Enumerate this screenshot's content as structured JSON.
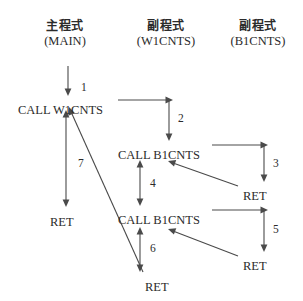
{
  "diagram": {
    "type": "call-return-flow",
    "stroke_color": "#4a4a4a",
    "text_color": "#2b2b2b",
    "background": "#ffffff",
    "columns": [
      {
        "id": "main",
        "cjk": "主程式",
        "romanized": "(MAIN)",
        "x": 65
      },
      {
        "id": "w1cnts",
        "cjk": "副程式",
        "romanized": "(W1CNTS)",
        "x": 166
      },
      {
        "id": "b1cnts",
        "cjk": "副程式",
        "romanized": "(B1CNTS)",
        "x": 258
      }
    ],
    "nodes": [
      {
        "id": "call-w1cnts",
        "label": "CALL W1CNTS",
        "x": 18,
        "y": 104
      },
      {
        "id": "call-b1cnts-1",
        "label": "CALL B1CNTS",
        "x": 118,
        "y": 149
      },
      {
        "id": "ret-right-1",
        "label": "RET",
        "x": 243,
        "y": 190
      },
      {
        "id": "call-b1cnts-2",
        "label": "CALL B1CNTS",
        "x": 118,
        "y": 214
      },
      {
        "id": "ret-left",
        "label": "RET",
        "x": 50,
        "y": 216
      },
      {
        "id": "ret-right-2",
        "label": "RET",
        "x": 243,
        "y": 260
      },
      {
        "id": "ret-bottom",
        "label": "RET",
        "x": 145,
        "y": 281
      }
    ],
    "steps": [
      {
        "number": "1",
        "x": 81,
        "y": 82,
        "from": "main-entry",
        "to": "call-w1cnts"
      },
      {
        "number": "2",
        "x": 178,
        "y": 125,
        "from": "call-w1cnts",
        "to": "call-b1cnts-1"
      },
      {
        "number": "3",
        "x": 284,
        "y": 168,
        "from": "call-b1cnts-1",
        "to": "ret-right-1"
      },
      {
        "number": "4",
        "x": 150,
        "y": 186,
        "from": "ret-right-1",
        "to": "call-b1cnts-2"
      },
      {
        "number": "5",
        "x": 284,
        "y": 236,
        "from": "call-b1cnts-2",
        "to": "ret-right-2"
      },
      {
        "number": "6",
        "x": 150,
        "y": 252,
        "from": "ret-right-2",
        "to": "ret-bottom"
      },
      {
        "number": "7",
        "x": 78,
        "y": 165,
        "from": "ret-bottom",
        "to": "ret-left"
      }
    ]
  }
}
